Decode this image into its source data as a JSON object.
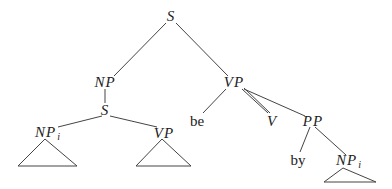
{
  "diagram": {
    "type": "syntax-tree",
    "line_color": "#444444",
    "text_color": "#222222",
    "nodes": [
      {
        "id": "s_root",
        "label": "S",
        "italic": true,
        "x": 171,
        "y": 16
      },
      {
        "id": "np_top",
        "label": "NP",
        "italic": true,
        "x": 105,
        "y": 82
      },
      {
        "id": "vp_top",
        "label": "VP",
        "italic": true,
        "x": 233,
        "y": 82
      },
      {
        "id": "s_inner",
        "label": "S",
        "italic": true,
        "x": 105,
        "y": 110
      },
      {
        "id": "np_i_left",
        "label": "NP",
        "sub": "i",
        "italic": true,
        "x": 45,
        "y": 133
      },
      {
        "id": "vp_inner",
        "label": "VP",
        "italic": true,
        "x": 163,
        "y": 133
      },
      {
        "id": "be",
        "label": "be",
        "italic": false,
        "x": 197,
        "y": 121
      },
      {
        "id": "v",
        "label": "V",
        "italic": true,
        "x": 271,
        "y": 121
      },
      {
        "id": "pp",
        "label": "PP",
        "italic": true,
        "x": 313,
        "y": 121
      },
      {
        "id": "by",
        "label": "by",
        "italic": false,
        "x": 298,
        "y": 160
      },
      {
        "id": "np_i_right",
        "label": "NP",
        "sub": "i",
        "italic": true,
        "x": 347,
        "y": 162
      }
    ],
    "edges": [
      [
        "s_root",
        "np_top"
      ],
      [
        "s_root",
        "vp_top"
      ],
      [
        "np_top",
        "s_inner"
      ],
      [
        "s_inner",
        "np_i_left"
      ],
      [
        "s_inner",
        "vp_inner"
      ],
      [
        "vp_top",
        "be"
      ],
      [
        "vp_top",
        "v"
      ],
      [
        "vp_top",
        "pp"
      ],
      [
        "pp",
        "by"
      ],
      [
        "pp",
        "np_i_right"
      ]
    ],
    "triangles": [
      {
        "under": "np_i_left"
      },
      {
        "under": "vp_inner"
      },
      {
        "under": "np_i_right"
      }
    ]
  }
}
